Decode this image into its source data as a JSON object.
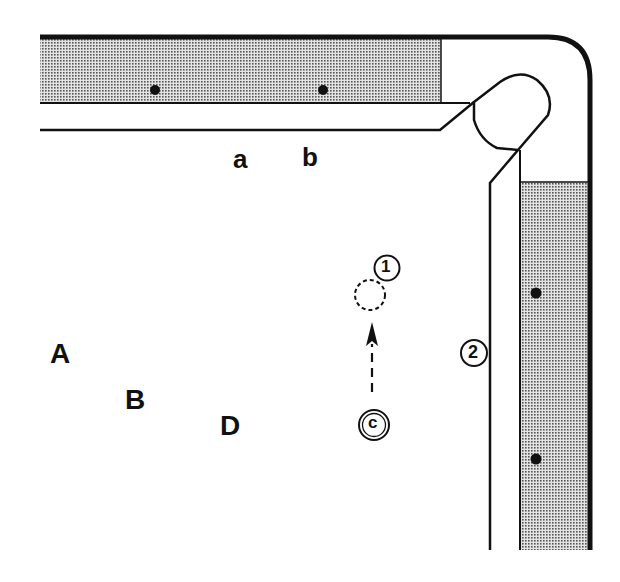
{
  "diagram": {
    "type": "billiard-table-corner",
    "colors": {
      "line": "#111111",
      "rail_fill": "#c8c8c8",
      "background": "#ffffff"
    },
    "rail_labels": [
      {
        "id": "a",
        "text": "a"
      },
      {
        "id": "b",
        "text": "b"
      }
    ],
    "position_labels": [
      {
        "id": "A",
        "text": "A"
      },
      {
        "id": "B",
        "text": "B"
      },
      {
        "id": "D",
        "text": "D"
      }
    ],
    "balls": [
      {
        "id": "ball-1",
        "label": "1"
      },
      {
        "id": "ball-2",
        "label": "2"
      },
      {
        "id": "cue-ball",
        "label": "c"
      }
    ],
    "ghost_ball": {
      "style": "dashed"
    },
    "aim_arrow": {
      "style": "dashed",
      "direction": "up"
    },
    "diamonds": {
      "top_rail": 2,
      "right_rail": 2
    },
    "pocket": {
      "location": "top-right corner"
    }
  }
}
